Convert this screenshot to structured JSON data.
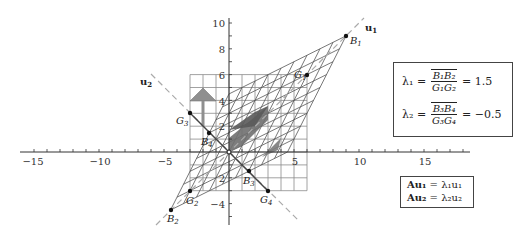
{
  "figure": {
    "type": "eigenvector-transformation-diagram",
    "axes": {
      "x_ticks": [
        "−15",
        "−10",
        "−5",
        "5",
        "10",
        "15"
      ],
      "y_ticks": [
        "10",
        "8",
        "6",
        "4",
        "2",
        "2",
        "−4"
      ],
      "x_range": [
        -16,
        18
      ],
      "y_range": [
        -5.5,
        10.5
      ]
    },
    "vectors": {
      "u1_label": "u",
      "u1_sub": "1",
      "u2_label": "u",
      "u2_sub": "2"
    },
    "points": {
      "B1": {
        "name": "B",
        "sub": "1"
      },
      "B2": {
        "name": "B",
        "sub": "2"
      },
      "B3": {
        "name": "B",
        "sub": "3"
      },
      "B4": {
        "name": "B",
        "sub": "4"
      },
      "G1": {
        "name": "G",
        "sub": "1"
      },
      "G2": {
        "name": "G",
        "sub": "2"
      },
      "G3": {
        "name": "G",
        "sub": "3"
      },
      "G4": {
        "name": "G",
        "sub": "4"
      }
    },
    "colors": {
      "grid": "#888888",
      "transformed_grid": "#555555",
      "shape_fill": "#8a8a8a",
      "transformed_shape_fill": "#6e6e6e",
      "dashed_line": "#aaaaaa",
      "axis": "#333333"
    }
  },
  "lambda_box": {
    "row1": {
      "lhs": "λ₁ =",
      "num": "B₁B₂",
      "den": "G₁G₂",
      "rhs": "= 1.5"
    },
    "row2": {
      "lhs": "λ₂ =",
      "num": "B₃B₄",
      "den": "G₃G₄",
      "rhs": "= −0.5"
    }
  },
  "eigen_box": {
    "row1": {
      "lhs": "Au₁",
      "eq": " = ",
      "rhs": "λ₁u₁"
    },
    "row2": {
      "lhs": "Au₂",
      "eq": " = ",
      "rhs": "λ₂u₂"
    }
  }
}
